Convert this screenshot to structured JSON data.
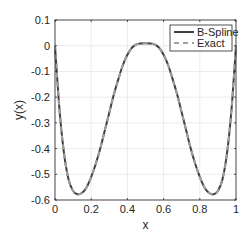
{
  "chart_data": {
    "type": "line",
    "title": "",
    "xlabel": "x",
    "ylabel": "y(x)",
    "xlim": [
      0,
      1
    ],
    "ylim": [
      -0.6,
      0.1
    ],
    "grid": true,
    "legend_position": "upper right",
    "xticks": [
      0,
      0.2,
      0.4,
      0.6,
      0.8,
      1
    ],
    "xtick_labels": [
      "0",
      "0.2",
      "0.4",
      "0.6",
      "0.8",
      "1"
    ],
    "yticks": [
      0.1,
      0,
      -0.1,
      -0.2,
      -0.3,
      -0.4,
      -0.5,
      -0.6
    ],
    "ytick_labels": [
      "0.1",
      "0",
      "-0.1",
      "-0.2",
      "-0.3",
      "-0.4",
      "-0.5",
      "-0.6"
    ],
    "x": [
      0,
      0.025,
      0.05,
      0.075,
      0.1,
      0.125,
      0.15,
      0.175,
      0.2,
      0.225,
      0.25,
      0.275,
      0.3,
      0.325,
      0.35,
      0.375,
      0.4,
      0.425,
      0.45,
      0.475,
      0.5,
      0.525,
      0.55,
      0.575,
      0.6,
      0.625,
      0.65,
      0.675,
      0.7,
      0.725,
      0.75,
      0.775,
      0.8,
      0.825,
      0.85,
      0.875,
      0.9,
      0.925,
      0.95,
      0.975,
      1
    ],
    "series": [
      {
        "name": "B-Spline",
        "style": "solid",
        "color": "#404040",
        "values": [
          0,
          -0.25,
          -0.42,
          -0.52,
          -0.565,
          -0.578,
          -0.572,
          -0.55,
          -0.51,
          -0.46,
          -0.4,
          -0.33,
          -0.26,
          -0.19,
          -0.13,
          -0.075,
          -0.035,
          -0.008,
          0.005,
          0.009,
          0.01,
          0.009,
          0.005,
          -0.008,
          -0.035,
          -0.075,
          -0.13,
          -0.19,
          -0.26,
          -0.33,
          -0.4,
          -0.46,
          -0.51,
          -0.55,
          -0.572,
          -0.578,
          -0.565,
          -0.52,
          -0.42,
          -0.25,
          0
        ]
      },
      {
        "name": "Exact",
        "style": "dashed",
        "color": "#a0a0a0",
        "values": [
          0,
          -0.25,
          -0.42,
          -0.52,
          -0.565,
          -0.578,
          -0.572,
          -0.55,
          -0.51,
          -0.46,
          -0.4,
          -0.33,
          -0.26,
          -0.19,
          -0.13,
          -0.075,
          -0.035,
          -0.008,
          0.005,
          0.009,
          0.01,
          0.009,
          0.005,
          -0.008,
          -0.035,
          -0.075,
          -0.13,
          -0.19,
          -0.26,
          -0.33,
          -0.4,
          -0.46,
          -0.51,
          -0.55,
          -0.572,
          -0.578,
          -0.565,
          -0.52,
          -0.42,
          -0.25,
          0
        ]
      }
    ]
  },
  "legend": {
    "items": [
      {
        "label": "B-Spline"
      },
      {
        "label": "Exact"
      }
    ]
  }
}
